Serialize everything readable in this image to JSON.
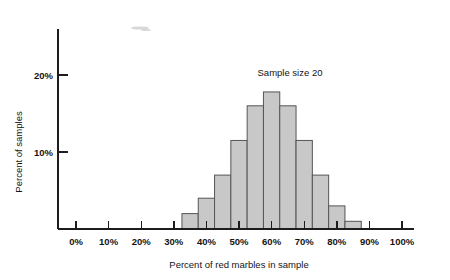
{
  "chart_data": {
    "type": "bar",
    "title": "",
    "annotation": "Sample size 20",
    "xlabel": "Percent of red marbles in sample",
    "ylabel": "Percent of samples",
    "xlim": [
      -5,
      103
    ],
    "ylim": [
      0,
      24
    ],
    "grid": false,
    "legend": null,
    "bin_width": 5,
    "x_tick_labels": [
      "0%",
      "10%",
      "20%",
      "30%",
      "40%",
      "50%",
      "60%",
      "70%",
      "80%",
      "90%",
      "100%"
    ],
    "x_tick_values": [
      0,
      10,
      20,
      30,
      40,
      50,
      60,
      70,
      80,
      90,
      100
    ],
    "y_tick_labels": [
      "10%",
      "20%"
    ],
    "y_tick_values": [
      10,
      20
    ],
    "bar_color": "#c8c8c8",
    "bar_edge_color": "#555555",
    "axis_color": "#1d1d1d",
    "bins": [
      {
        "left": 32.5,
        "right": 37.5,
        "center": 35,
        "value": 2.0
      },
      {
        "left": 37.5,
        "right": 42.5,
        "center": 40,
        "value": 4.0
      },
      {
        "left": 42.5,
        "right": 47.5,
        "center": 45,
        "value": 7.0
      },
      {
        "left": 47.5,
        "right": 52.5,
        "center": 50,
        "value": 11.5
      },
      {
        "left": 52.5,
        "right": 57.5,
        "center": 55,
        "value": 16.0
      },
      {
        "left": 57.5,
        "right": 62.5,
        "center": 60,
        "value": 17.8
      },
      {
        "left": 62.5,
        "right": 67.5,
        "center": 65,
        "value": 16.0
      },
      {
        "left": 67.5,
        "right": 72.5,
        "center": 70,
        "value": 11.5
      },
      {
        "left": 72.5,
        "right": 77.5,
        "center": 75,
        "value": 7.0
      },
      {
        "left": 77.5,
        "right": 82.5,
        "center": 80,
        "value": 3.0
      },
      {
        "left": 82.5,
        "right": 87.5,
        "center": 85,
        "value": 1.0
      }
    ]
  }
}
